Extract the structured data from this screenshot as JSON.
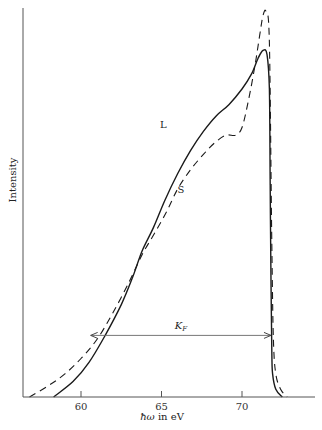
{
  "chart_data": {
    "type": "line",
    "title": "",
    "xlabel": "ħω in eV",
    "ylabel": "Intensity",
    "xlim": [
      56.4,
      74.5
    ],
    "ylim": [
      0,
      100
    ],
    "xticks": [
      60,
      65,
      70
    ],
    "xtick_labels": [
      "60",
      "65",
      "70"
    ],
    "yticks": [],
    "grid": false,
    "legend": "none (curves labelled inline: L, S)",
    "series": [
      {
        "name": "L",
        "style": "solid",
        "x": [
          58.3,
          59.5,
          60.5,
          61.5,
          62.5,
          63.2,
          63.8,
          64.5,
          65.2,
          66.0,
          66.8,
          67.6,
          68.4,
          69.2,
          70.0,
          70.6,
          71.0,
          71.3,
          71.55,
          71.7,
          71.75,
          71.8,
          71.85,
          71.9,
          72.1,
          72.5
        ],
        "y": [
          0,
          4,
          9,
          16,
          24,
          31,
          38,
          44,
          51,
          58,
          64,
          69,
          73,
          76,
          80,
          84,
          88,
          90,
          89,
          80,
          55,
          30,
          12,
          6,
          2,
          0
        ]
      },
      {
        "name": "S",
        "style": "dashed",
        "x": [
          56.8,
          58.0,
          59.0,
          60.0,
          61.0,
          62.0,
          63.0,
          63.8,
          64.5,
          65.3,
          66.0,
          66.8,
          67.6,
          68.3,
          69.0,
          69.6,
          70.0,
          70.4,
          70.8,
          71.1,
          71.3,
          71.5,
          71.7,
          71.85,
          71.95,
          72.1,
          72.4,
          72.8
        ],
        "y": [
          0,
          3,
          6,
          10,
          15,
          22,
          30,
          37,
          42,
          48,
          54,
          59,
          63,
          66,
          68,
          68,
          70,
          77,
          86,
          94,
          99,
          100,
          92,
          40,
          15,
          6,
          2,
          0
        ]
      }
    ],
    "annotations": [
      {
        "text": "L",
        "x": 64.9,
        "y": 70,
        "series": "L"
      },
      {
        "text": "S",
        "x": 66.0,
        "y": 53,
        "series": "S"
      },
      {
        "text": "K_F",
        "type": "double-arrow",
        "x_start": 60.6,
        "x_end": 71.8,
        "y": 16,
        "label_x": 66.2
      }
    ]
  },
  "labels": {
    "ylabel": "Intensity",
    "xlabel_hbar": "ħω",
    "xlabel_rest": " in eV",
    "curve_L": "L",
    "curve_S": "S",
    "kf_main": "K",
    "kf_sub": "F"
  }
}
